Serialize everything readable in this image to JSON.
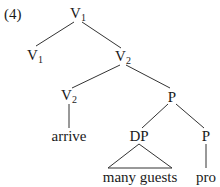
{
  "example_number": "(4)",
  "tree": {
    "nodes": {
      "root": {
        "label": "V",
        "sub": "1",
        "x": 78,
        "y": 15
      },
      "v1": {
        "label": "V",
        "sub": "1",
        "x": 35,
        "y": 57
      },
      "v2": {
        "label": "V",
        "sub": "2",
        "x": 123,
        "y": 58
      },
      "v2low": {
        "label": "V",
        "sub": "2",
        "x": 69,
        "y": 97
      },
      "p": {
        "label": "P",
        "sub": "",
        "x": 172,
        "y": 97
      },
      "arrive": {
        "label": "arrive",
        "sub": "",
        "x": 69,
        "y": 136
      },
      "dp": {
        "label": "DP",
        "sub": "",
        "x": 139,
        "y": 136
      },
      "plow": {
        "label": "P",
        "sub": "",
        "x": 206,
        "y": 136
      },
      "many": {
        "label": "many guests",
        "sub": "",
        "x": 140,
        "y": 177
      },
      "pro": {
        "label": "pro",
        "sub": "",
        "x": 206,
        "y": 177
      }
    },
    "edges": [
      [
        "root",
        "v1"
      ],
      [
        "root",
        "v2"
      ],
      [
        "v2",
        "v2low"
      ],
      [
        "v2",
        "p"
      ],
      [
        "v2low",
        "arrive"
      ],
      [
        "p",
        "dp"
      ],
      [
        "p",
        "plow"
      ],
      [
        "plow",
        "pro"
      ]
    ],
    "triangle": {
      "apex": "dp",
      "base": "many"
    }
  }
}
